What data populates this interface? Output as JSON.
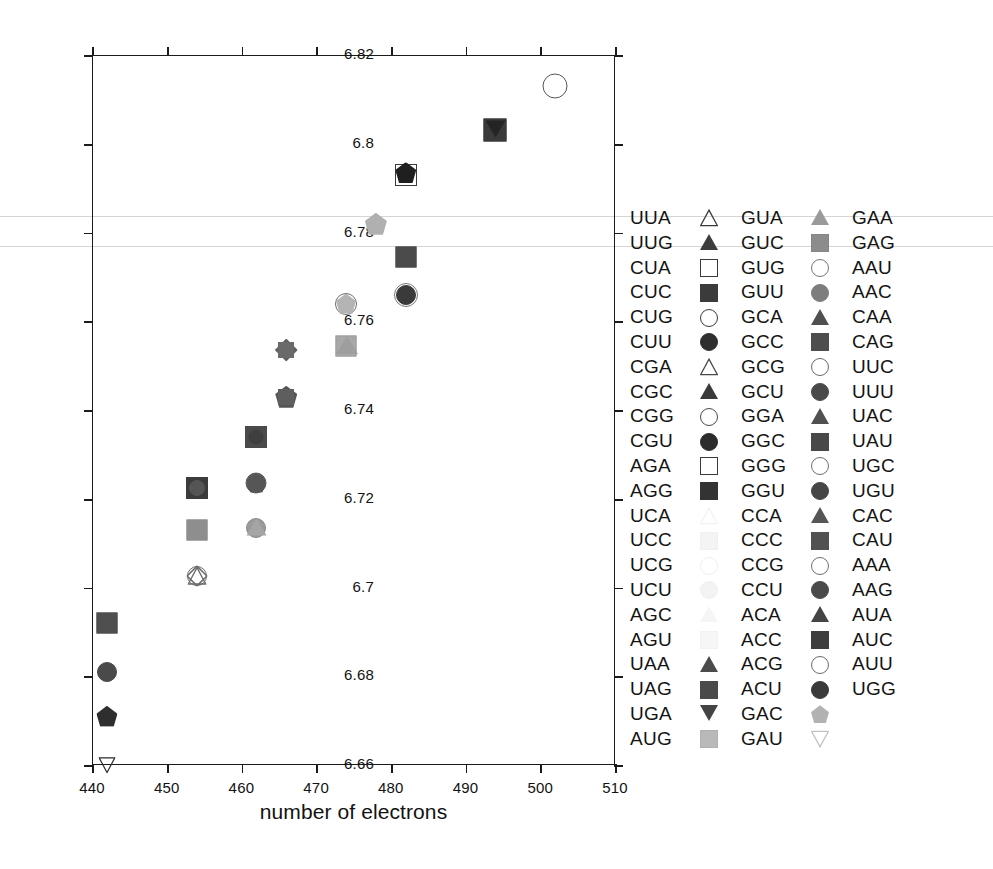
{
  "chart_data": {
    "type": "scatter",
    "title": "",
    "xlabel": "number of electrons",
    "ylabel": "",
    "xlim": [
      440,
      510
    ],
    "ylim": [
      6.66,
      6.82
    ],
    "xticks": [
      440,
      450,
      460,
      470,
      480,
      490,
      500,
      510
    ],
    "yticks": [
      6.66,
      6.68,
      6.7,
      6.72,
      6.74,
      6.76,
      6.78,
      6.8,
      6.82
    ],
    "xticklabels": [
      "440",
      "450",
      "460",
      "470",
      "480",
      "490",
      "500",
      "510"
    ],
    "yticklabels": [
      "6.66",
      "6.68",
      "6.7",
      "6.72",
      "6.74",
      "6.76",
      "6.78",
      "6.8",
      "6.82"
    ],
    "grid": false,
    "legend_position": "right",
    "points": [
      {
        "label": "UGA",
        "x": 442.0,
        "y": 6.66,
        "shape": "down-triangle",
        "fill": "none",
        "stroke": "#2b2b2b",
        "size": 17
      },
      {
        "label": "UAG",
        "x": 442.0,
        "y": 6.692,
        "shape": "square",
        "fill": "#4f4f4f",
        "stroke": "#4f4f4f",
        "size": 21
      },
      {
        "label": "UUU",
        "x": 442.0,
        "y": 6.681,
        "shape": "circle",
        "fill": "#4a4a4a",
        "stroke": "#4a4a4a",
        "size": 20
      },
      {
        "label": "GAC",
        "x": 442.0,
        "y": 6.671,
        "shape": "pentagon",
        "fill": "#2e2e2e",
        "stroke": "#2e2e2e",
        "size": 21
      },
      {
        "label": "AGG",
        "x": 454.0,
        "y": 6.7225,
        "shape": "square",
        "fill": "#3b3b3b",
        "stroke": "#3b3b3b",
        "size": 22
      },
      {
        "label": "CUU",
        "x": 454.0,
        "y": 6.7225,
        "shape": "circle",
        "fill": "#555555",
        "stroke": "#555555",
        "size": 16
      },
      {
        "label": "AUG",
        "x": 454.0,
        "y": 6.713,
        "shape": "square",
        "fill": "#8e8e8e",
        "stroke": "#8e8e8e",
        "size": 21
      },
      {
        "label": "CGG",
        "x": 454.0,
        "y": 6.7025,
        "shape": "circle",
        "fill": "none",
        "stroke": "#6a6a6a",
        "size": 20
      },
      {
        "label": "CGA",
        "x": 454.0,
        "y": 6.7025,
        "shape": "triangle",
        "fill": "none",
        "stroke": "#6a6a6a",
        "size": 19
      },
      {
        "label": "UUA",
        "x": 454.0,
        "y": 6.7025,
        "shape": "diamond",
        "fill": "none",
        "stroke": "#6a6a6a",
        "size": 21
      },
      {
        "label": "GGC",
        "x": 462.0,
        "y": 6.734,
        "shape": "square",
        "fill": "#4a4a4a",
        "stroke": "#4a4a4a",
        "size": 22
      },
      {
        "label": "GGU",
        "x": 462.0,
        "y": 6.734,
        "shape": "circle",
        "fill": "#3f3f3f",
        "stroke": "#3f3f3f",
        "size": 15
      },
      {
        "label": "GCU",
        "x": 462.0,
        "y": 6.7235,
        "shape": "circle",
        "fill": "#5a5a5a",
        "stroke": "#5a5a5a",
        "size": 21
      },
      {
        "label": "GGA",
        "x": 462.0,
        "y": 6.7235,
        "shape": "pentagon",
        "fill": "#565656",
        "stroke": "#565656",
        "size": 19
      },
      {
        "label": "GCG",
        "x": 462.0,
        "y": 6.7135,
        "shape": "circle",
        "fill": "#9a9a9a",
        "stroke": "#8a8a8a",
        "size": 20
      },
      {
        "label": "GCA",
        "x": 462.0,
        "y": 6.7135,
        "shape": "triangle",
        "fill": "#a5a5a5",
        "stroke": "#9a9a9a",
        "size": 19
      },
      {
        "label": "CCU",
        "x": 466.0,
        "y": 6.743,
        "shape": "pentagon",
        "fill": "#565656",
        "stroke": "#565656",
        "size": 22
      },
      {
        "label": "CCA",
        "x": 466.0,
        "y": 6.743,
        "shape": "square",
        "fill": "#5e5e5e",
        "stroke": "#5e5e5e",
        "size": 16
      },
      {
        "label": "ACU",
        "x": 466.0,
        "y": 6.7535,
        "shape": "diamond",
        "fill": "#606060",
        "stroke": "#606060",
        "size": 23
      },
      {
        "label": "ACC",
        "x": 466.0,
        "y": 6.7535,
        "shape": "square",
        "fill": "#6a6a6a",
        "stroke": "#6a6a6a",
        "size": 16
      },
      {
        "label": "CCC",
        "x": 474.0,
        "y": 6.764,
        "shape": "circle",
        "fill": "none",
        "stroke": "#6e6e6e",
        "size": 22
      },
      {
        "label": "CCG",
        "x": 474.0,
        "y": 6.764,
        "shape": "pentagon",
        "fill": "#b4b4b4",
        "stroke": "#a6a6a6",
        "size": 20
      },
      {
        "label": "ACA",
        "x": 474.0,
        "y": 6.7545,
        "shape": "square",
        "fill": "#a8a8a8",
        "stroke": "#9c9c9c",
        "size": 21
      },
      {
        "label": "ACG",
        "x": 474.0,
        "y": 6.7545,
        "shape": "triangle",
        "fill": "#9e9e9e",
        "stroke": "#949494",
        "size": 20
      },
      {
        "label": "GAU",
        "x": 478.0,
        "y": 6.782,
        "shape": "pentagon",
        "fill": "#b0b0b0",
        "stroke": "#a2a2a2",
        "size": 22
      },
      {
        "label": "UGU",
        "x": 482.0,
        "y": 6.766,
        "shape": "circle",
        "fill": "#3a3a3a",
        "stroke": "#3a3a3a",
        "size": 20
      },
      {
        "label": "UGC",
        "x": 482.0,
        "y": 6.766,
        "shape": "circle",
        "fill": "none",
        "stroke": "#777777",
        "size": 24
      },
      {
        "label": "UAU",
        "x": 482.0,
        "y": 6.7745,
        "shape": "square",
        "fill": "#4b4b4b",
        "stroke": "#4b4b4b",
        "size": 21
      },
      {
        "label": "UAC",
        "x": 482.0,
        "y": 6.7745,
        "shape": "triangle",
        "fill": "#4b4b4b",
        "stroke": "#4b4b4b",
        "size": 15
      },
      {
        "label": "CAG",
        "x": 482.0,
        "y": 6.793,
        "shape": "square",
        "fill": "none",
        "stroke": "#3a3a3a",
        "size": 22
      },
      {
        "label": "CAA",
        "x": 482.0,
        "y": 6.7935,
        "shape": "pentagon",
        "fill": "#1f1f1f",
        "stroke": "#1f1f1f",
        "size": 21
      },
      {
        "label": "AAC",
        "x": 494.0,
        "y": 6.803,
        "shape": "square",
        "fill": "#3a3a3a",
        "stroke": "#3a3a3a",
        "size": 23
      },
      {
        "label": "AAU",
        "x": 494.0,
        "y": 6.803,
        "shape": "down-triangle",
        "fill": "#242424",
        "stroke": "#242424",
        "size": 19
      },
      {
        "label": "UGG",
        "x": 502.0,
        "y": 6.813,
        "shape": "circle",
        "fill": "none",
        "stroke": "#555555",
        "size": 25
      }
    ]
  },
  "legend": {
    "columns": [
      {
        "items": [
          {
            "label": "UUA",
            "shape": "triangle",
            "fill": "none",
            "stroke": "#3a3a3a"
          },
          {
            "label": "UUG",
            "shape": "triangle",
            "fill": "#3c3c3c",
            "stroke": "#3c3c3c"
          },
          {
            "label": "CUA",
            "shape": "square",
            "fill": "none",
            "stroke": "#3a3a3a"
          },
          {
            "label": "CUC",
            "shape": "square",
            "fill": "#3b3b3b",
            "stroke": "#3b3b3b"
          },
          {
            "label": "CUG",
            "shape": "circle",
            "fill": "none",
            "stroke": "#3a3a3a"
          },
          {
            "label": "CUU",
            "shape": "circle",
            "fill": "#2f2f2f",
            "stroke": "#2f2f2f"
          },
          {
            "label": "CGA",
            "shape": "triangle",
            "fill": "none",
            "stroke": "#4a4a4a"
          },
          {
            "label": "CGC",
            "shape": "triangle",
            "fill": "#3a3a3a",
            "stroke": "#3a3a3a"
          },
          {
            "label": "CGG",
            "shape": "circle",
            "fill": "none",
            "stroke": "#4a4a4a"
          },
          {
            "label": "CGU",
            "shape": "circle",
            "fill": "#2c2c2c",
            "stroke": "#2c2c2c"
          },
          {
            "label": "AGA",
            "shape": "square",
            "fill": "none",
            "stroke": "#3a3a3a"
          },
          {
            "label": "AGG",
            "shape": "square",
            "fill": "#333333",
            "stroke": "#333333"
          },
          {
            "label": "UCA",
            "shape": "triangle",
            "fill": "none",
            "stroke": "#f2f2f2"
          },
          {
            "label": "UCC",
            "shape": "square",
            "fill": "#f4f4f4",
            "stroke": "#f0f0f0"
          },
          {
            "label": "UCG",
            "shape": "circle",
            "fill": "none",
            "stroke": "#f0f0f0"
          },
          {
            "label": "UCU",
            "shape": "circle",
            "fill": "#f3f3f3",
            "stroke": "#f0f0f0"
          },
          {
            "label": "AGC",
            "shape": "triangle",
            "fill": "#f5f5f5",
            "stroke": "#f1f1f1"
          },
          {
            "label": "AGU",
            "shape": "square",
            "fill": "#f6f6f6",
            "stroke": "#f2f2f2"
          },
          {
            "label": "UAA",
            "shape": "triangle",
            "fill": "#4b4b4b",
            "stroke": "#4b4b4b"
          },
          {
            "label": "UAG",
            "shape": "square",
            "fill": "#4a4a4a",
            "stroke": "#4a4a4a"
          },
          {
            "label": "UGA",
            "shape": "down-triangle",
            "fill": "#444444",
            "stroke": "#444444"
          },
          {
            "label": "AUG",
            "shape": "square",
            "fill": "#b9b9b9",
            "stroke": "#b0b0b0"
          }
        ]
      },
      {
        "items": [
          {
            "label": "GUA",
            "shape": "triangle",
            "fill": "#9a9a9a",
            "stroke": "#929292"
          },
          {
            "label": "GUC",
            "shape": "square",
            "fill": "#8c8c8c",
            "stroke": "#868686"
          },
          {
            "label": "GUG",
            "shape": "circle",
            "fill": "none",
            "stroke": "#787878"
          },
          {
            "label": "GUU",
            "shape": "circle",
            "fill": "#7d7d7d",
            "stroke": "#7d7d7d"
          },
          {
            "label": "GCA",
            "shape": "triangle",
            "fill": "#4f4f4f",
            "stroke": "#4f4f4f"
          },
          {
            "label": "GCC",
            "shape": "square",
            "fill": "#4d4d4d",
            "stroke": "#4d4d4d"
          },
          {
            "label": "GCG",
            "shape": "circle",
            "fill": "none",
            "stroke": "#6a6a6a"
          },
          {
            "label": "GCU",
            "shape": "circle",
            "fill": "#4a4a4a",
            "stroke": "#4a4a4a"
          },
          {
            "label": "GGA",
            "shape": "triangle",
            "fill": "#505050",
            "stroke": "#505050"
          },
          {
            "label": "GGC",
            "shape": "square",
            "fill": "#484848",
            "stroke": "#484848"
          },
          {
            "label": "GGG",
            "shape": "circle",
            "fill": "none",
            "stroke": "#6e6e6e"
          },
          {
            "label": "GGU",
            "shape": "circle",
            "fill": "#464646",
            "stroke": "#464646"
          },
          {
            "label": "CCA",
            "shape": "triangle",
            "fill": "#565656",
            "stroke": "#565656"
          },
          {
            "label": "CCC",
            "shape": "square",
            "fill": "#525252",
            "stroke": "#525252"
          },
          {
            "label": "CCG",
            "shape": "circle",
            "fill": "none",
            "stroke": "#6e6e6e"
          },
          {
            "label": "CCU",
            "shape": "circle",
            "fill": "#4b4b4b",
            "stroke": "#4b4b4b"
          },
          {
            "label": "ACA",
            "shape": "triangle",
            "fill": "#444444",
            "stroke": "#444444"
          },
          {
            "label": "ACC",
            "shape": "square",
            "fill": "#3f3f3f",
            "stroke": "#3f3f3f"
          },
          {
            "label": "ACG",
            "shape": "circle",
            "fill": "none",
            "stroke": "#6b6b6b"
          },
          {
            "label": "ACU",
            "shape": "circle",
            "fill": "#3a3a3a",
            "stroke": "#3a3a3a"
          },
          {
            "label": "GAC",
            "shape": "pentagon",
            "fill": "#b2b2b2",
            "stroke": "#aaaaaa"
          },
          {
            "label": "GAU",
            "shape": "down-triangle",
            "fill": "none",
            "stroke": "#c2c2c2"
          }
        ]
      },
      {
        "items": [
          {
            "label": "GAA",
            "shape": "none",
            "fill": "none",
            "stroke": "none"
          },
          {
            "label": "GAG",
            "shape": "none",
            "fill": "none",
            "stroke": "none"
          },
          {
            "label": "AAU",
            "shape": "none",
            "fill": "none",
            "stroke": "none"
          },
          {
            "label": "AAC",
            "shape": "none",
            "fill": "none",
            "stroke": "none"
          },
          {
            "label": "CAA",
            "shape": "none",
            "fill": "none",
            "stroke": "none"
          },
          {
            "label": "CAG",
            "shape": "none",
            "fill": "none",
            "stroke": "none"
          },
          {
            "label": "UUC",
            "shape": "none",
            "fill": "none",
            "stroke": "none"
          },
          {
            "label": "UUU",
            "shape": "none",
            "fill": "none",
            "stroke": "none"
          },
          {
            "label": "UAC",
            "shape": "none",
            "fill": "none",
            "stroke": "none"
          },
          {
            "label": "UAU",
            "shape": "none",
            "fill": "none",
            "stroke": "none"
          },
          {
            "label": "UGC",
            "shape": "none",
            "fill": "none",
            "stroke": "none"
          },
          {
            "label": "UGU",
            "shape": "none",
            "fill": "none",
            "stroke": "none"
          },
          {
            "label": "CAC",
            "shape": "none",
            "fill": "none",
            "stroke": "none"
          },
          {
            "label": "CAU",
            "shape": "none",
            "fill": "none",
            "stroke": "none"
          },
          {
            "label": "AAA",
            "shape": "none",
            "fill": "none",
            "stroke": "none"
          },
          {
            "label": "AAG",
            "shape": "none",
            "fill": "none",
            "stroke": "none"
          },
          {
            "label": "AUA",
            "shape": "none",
            "fill": "none",
            "stroke": "none"
          },
          {
            "label": "AUC",
            "shape": "none",
            "fill": "none",
            "stroke": "none"
          },
          {
            "label": "AUU",
            "shape": "none",
            "fill": "none",
            "stroke": "none"
          },
          {
            "label": "UGG",
            "shape": "none",
            "fill": "none",
            "stroke": "none"
          }
        ]
      }
    ]
  }
}
